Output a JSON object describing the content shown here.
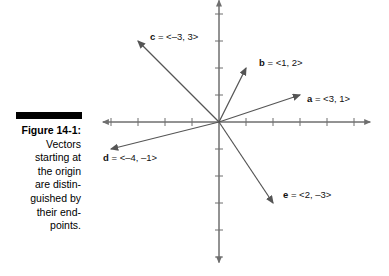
{
  "figure": {
    "caption_title": "Figure 14-1:",
    "caption_text": "Vectors\nstarting at\nthe origin\nare distin-\nguished by\ntheir end-\npoints."
  },
  "chart_data": {
    "type": "scatter",
    "title": "",
    "xlabel": "",
    "ylabel": "",
    "xlim": [
      -4.3,
      5.6
    ],
    "ylim": [
      -5.2,
      4.5
    ],
    "grid": false,
    "legend": "none",
    "axis_style": "arrowed-cross-axes-with-unit-ticks",
    "tick_step": 1,
    "origin_label": "",
    "vectors": [
      {
        "name": "a",
        "label": "a = <3, 1>",
        "x": 3,
        "y": 1,
        "label_x": 307,
        "label_y": 93
      },
      {
        "name": "b",
        "label": "b = <1, 2>",
        "x": 1,
        "y": 2,
        "label_x": 259,
        "label_y": 57
      },
      {
        "name": "c",
        "label": "c = <–3, 3>",
        "x": -3,
        "y": 3,
        "label_x": 150,
        "label_y": 31
      },
      {
        "name": "d",
        "label": "d = <–4, –1>",
        "x": -4,
        "y": -1,
        "label_x": 103,
        "label_y": 152
      },
      {
        "name": "e",
        "label": "e = <2, –3>",
        "x": 2,
        "y": -3,
        "label_x": 283,
        "label_y": 189
      }
    ]
  },
  "colors": {
    "axis": "#6f6f6f",
    "vector": "#555555",
    "text": "#111111",
    "rule": "#000000",
    "background": "#ffffff"
  }
}
